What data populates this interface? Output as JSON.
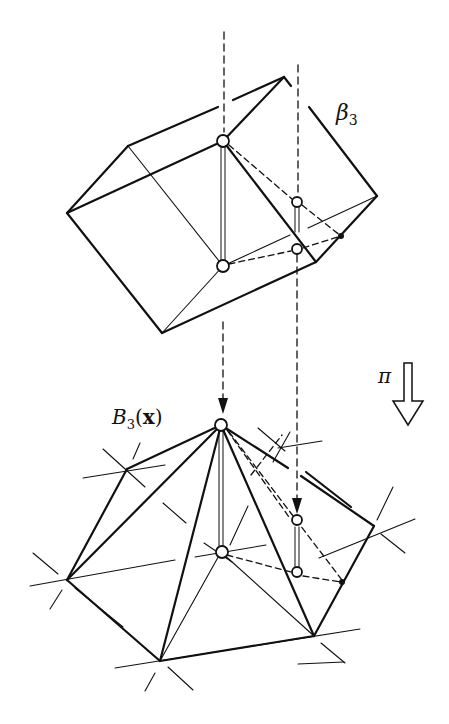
{
  "figure": {
    "type": "projection-diagram",
    "labels": {
      "beta": {
        "main": "β",
        "sub": "3"
      },
      "B": {
        "main": "B",
        "sub": "3",
        "arg_open": "(",
        "arg": "x",
        "arg_close": ")"
      },
      "pi": "π"
    },
    "colors": {
      "stroke": "#111111",
      "background": "#ffffff"
    }
  }
}
